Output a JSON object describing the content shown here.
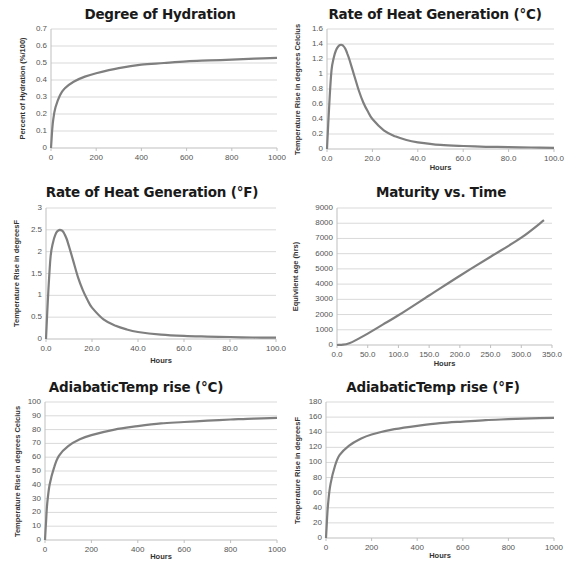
{
  "chart_data": [
    {
      "id": "hydration",
      "type": "line",
      "title": "Degree of Hydration",
      "xlabel": "",
      "ylabel": "Percent of Hydration (%/100)",
      "xlim": [
        0,
        1000
      ],
      "ylim": [
        0,
        0.7
      ],
      "xticks": [
        "0",
        "200",
        "400",
        "600",
        "800",
        "1000"
      ],
      "yticks": [
        "0",
        "0.1",
        "0.2",
        "0.3",
        "0.4",
        "0.5",
        "0.6",
        "0.7"
      ],
      "grid": true,
      "legend": "none",
      "x": [
        0,
        5,
        10,
        20,
        40,
        60,
        100,
        150,
        200,
        300,
        400,
        500,
        600,
        700,
        800,
        900,
        1000
      ],
      "series": [
        {
          "name": "Degree of Hydration",
          "values": [
            0,
            0.1,
            0.17,
            0.24,
            0.31,
            0.35,
            0.39,
            0.42,
            0.44,
            0.47,
            0.49,
            0.5,
            0.51,
            0.515,
            0.52,
            0.525,
            0.53
          ]
        }
      ]
    },
    {
      "id": "rate-c",
      "type": "line",
      "title": "Rate of Heat Generation (°C)",
      "xlabel": "Hours",
      "ylabel": "Temperature Rise in degrees Celcius",
      "xlim": [
        0,
        100
      ],
      "ylim": [
        0,
        1.6
      ],
      "xticks": [
        "0.0",
        "20.0",
        "40.0",
        "60.0",
        "80.0",
        "100.0"
      ],
      "yticks": [
        "0",
        "0.2",
        "0.4",
        "0.6",
        "0.8",
        "1",
        "1.2",
        "1.4",
        "1.6"
      ],
      "grid": true,
      "legend": "none",
      "x": [
        0,
        1,
        2,
        3,
        4,
        5,
        6,
        7,
        8,
        9,
        10,
        12,
        14,
        16,
        18,
        20,
        25,
        30,
        35,
        40,
        50,
        60,
        70,
        80,
        90,
        100
      ],
      "series": [
        {
          "name": "Rate (°C)",
          "values": [
            0,
            0.6,
            1.05,
            1.22,
            1.32,
            1.37,
            1.39,
            1.38,
            1.34,
            1.27,
            1.18,
            0.98,
            0.78,
            0.62,
            0.5,
            0.4,
            0.25,
            0.17,
            0.12,
            0.09,
            0.055,
            0.04,
            0.03,
            0.025,
            0.02,
            0.015
          ]
        }
      ]
    },
    {
      "id": "rate-f",
      "type": "line",
      "title": "Rate of Heat Generation (°F)",
      "xlabel": "Hours",
      "ylabel": "Temperature Rise in degreesF",
      "xlim": [
        0,
        100
      ],
      "ylim": [
        0,
        3
      ],
      "xticks": [
        "0.0",
        "20.0",
        "40.0",
        "60.0",
        "80.0",
        "100.0"
      ],
      "yticks": [
        "0",
        "0.5",
        "1",
        "1.5",
        "2",
        "2.5",
        "3"
      ],
      "grid": true,
      "legend": "none",
      "x": [
        0,
        1,
        2,
        3,
        4,
        5,
        6,
        7,
        8,
        9,
        10,
        12,
        14,
        16,
        18,
        20,
        25,
        30,
        35,
        40,
        50,
        60,
        70,
        80,
        90,
        100
      ],
      "series": [
        {
          "name": "Rate (°F)",
          "values": [
            0,
            1.08,
            1.89,
            2.2,
            2.38,
            2.47,
            2.5,
            2.48,
            2.41,
            2.29,
            2.12,
            1.76,
            1.4,
            1.12,
            0.9,
            0.72,
            0.45,
            0.31,
            0.22,
            0.16,
            0.1,
            0.07,
            0.055,
            0.045,
            0.035,
            0.03
          ]
        }
      ]
    },
    {
      "id": "maturity",
      "type": "line",
      "title": "Maturity vs. Time",
      "xlabel": "Hours",
      "ylabel": "Equivilent age  (hrs)",
      "xlim": [
        0,
        350
      ],
      "ylim": [
        0,
        9000
      ],
      "xticks": [
        "0.0",
        "50.0",
        "100.0",
        "150.0",
        "200.0",
        "250.0",
        "300.0",
        "350.0"
      ],
      "yticks": [
        "0",
        "1000",
        "2000",
        "3000",
        "4000",
        "5000",
        "6000",
        "7000",
        "8000",
        "9000"
      ],
      "grid": true,
      "legend": "none",
      "x": [
        0,
        10,
        20,
        30,
        50,
        75,
        100,
        150,
        200,
        250,
        300,
        337
      ],
      "series": [
        {
          "name": "Equivalent age",
          "values": [
            0,
            20,
            120,
            300,
            750,
            1350,
            1950,
            3250,
            4550,
            5800,
            7050,
            8200
          ]
        }
      ]
    },
    {
      "id": "adiabatic-c",
      "type": "line",
      "title": "AdiabaticTemp rise (°C)",
      "xlabel": "Hours",
      "ylabel": "Temperature Rise in degrees Celcius",
      "xlim": [
        0,
        1000
      ],
      "ylim": [
        0,
        100
      ],
      "xticks": [
        "0",
        "200",
        "400",
        "600",
        "800",
        "1000"
      ],
      "yticks": [
        "0",
        "10",
        "20",
        "30",
        "40",
        "50",
        "60",
        "70",
        "80",
        "90",
        "100"
      ],
      "grid": true,
      "legend": "none",
      "x": [
        0,
        5,
        10,
        20,
        40,
        60,
        100,
        150,
        200,
        300,
        400,
        500,
        600,
        700,
        800,
        900,
        1000
      ],
      "series": [
        {
          "name": "Adiabatic rise (°C)",
          "values": [
            0,
            15,
            27,
            40,
            53,
            61,
            68,
            73,
            76,
            80,
            82.5,
            84.5,
            85.5,
            86.5,
            87.3,
            88,
            88.5
          ]
        }
      ]
    },
    {
      "id": "adiabatic-f",
      "type": "line",
      "title": "AdiabaticTemp rise (°F)",
      "xlabel": "Hours",
      "ylabel": "Temperature Rise in degreesF",
      "xlim": [
        0,
        1000
      ],
      "ylim": [
        0,
        180
      ],
      "xticks": [
        "0",
        "200",
        "400",
        "600",
        "800",
        "1000"
      ],
      "yticks": [
        "0",
        "20",
        "40",
        "60",
        "80",
        "100",
        "120",
        "140",
        "160",
        "180"
      ],
      "grid": true,
      "legend": "none",
      "x": [
        0,
        5,
        10,
        20,
        40,
        60,
        100,
        150,
        200,
        300,
        400,
        500,
        600,
        700,
        800,
        900,
        1000
      ],
      "series": [
        {
          "name": "Adiabatic rise (°F)",
          "values": [
            0,
            27,
            48,
            72,
            96,
            110,
            122,
            131,
            137,
            144,
            148.5,
            152,
            154,
            156,
            157.2,
            158.3,
            159
          ]
        }
      ]
    }
  ],
  "layout": {
    "line_color": "#7f7f7f",
    "grid_color": "#d9d9d9",
    "axis_color": "#bfbfbf"
  }
}
